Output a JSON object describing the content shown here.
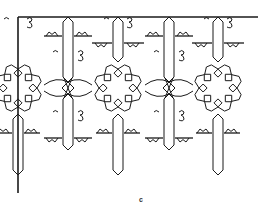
{
  "figure": {
    "caption": "c",
    "stroke_color": "#1a1a1a",
    "background": "#ffffff",
    "border": {
      "top_y": 17,
      "left_x": 18,
      "right_x": 258,
      "bottom_y": 193
    },
    "long_bars_x": [
      68,
      169
    ],
    "short_bars_x": [
      118,
      218
    ],
    "knot_y": 88,
    "star_centers": [
      [
        18,
        88
      ],
      [
        118,
        88
      ],
      [
        218,
        88
      ]
    ],
    "knot_centers": [
      [
        68,
        88
      ],
      [
        169,
        88
      ]
    ],
    "scroll_pairs": [
      [
        68,
        58
      ],
      [
        169,
        58
      ],
      [
        68,
        118
      ],
      [
        169,
        118
      ]
    ],
    "top_scrolls_x": [
      18,
      118,
      218
    ],
    "lower_long_bars_x": [
      68,
      169
    ],
    "lower_short_bars_x": [
      18,
      118,
      218
    ]
  }
}
